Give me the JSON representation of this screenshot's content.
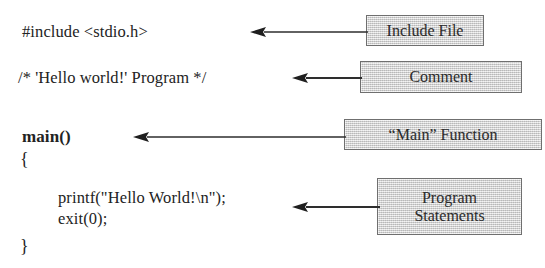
{
  "figure": {
    "background_color": "#ffffff",
    "box_fill_color": "#d6d6d6",
    "box_border_color": "#6f6f6f",
    "text_color": "#232323"
  },
  "code": {
    "lines": [
      {
        "id": "include",
        "text": "#include <stdio.h>",
        "bold": false
      },
      {
        "id": "comment",
        "text": "/* 'Hello world!' Program */",
        "bold": false
      },
      {
        "id": "main",
        "text": "main()",
        "bold": true
      },
      {
        "id": "open_brace",
        "text": "{",
        "bold": false
      },
      {
        "id": "printf",
        "text": "printf(\"Hello World!\\n\");",
        "bold": false
      },
      {
        "id": "exit",
        "text": "exit(0);",
        "bold": false
      },
      {
        "id": "close_brace",
        "text": "}",
        "bold": false
      }
    ]
  },
  "callouts": [
    {
      "id": "include_file",
      "label": "Include File"
    },
    {
      "id": "comment",
      "label": "Comment"
    },
    {
      "id": "main_function",
      "label": "“Main” Function"
    },
    {
      "id": "program_statements",
      "label_line1": "Program",
      "label_line2": "Statements"
    }
  ],
  "arrows": [
    {
      "id": "include_arrow",
      "direction": "left",
      "from": "Include File",
      "to": "#include <stdio.h>"
    },
    {
      "id": "comment_arrow",
      "direction": "left",
      "from": "Comment",
      "to": "/* 'Hello world!' Program */"
    },
    {
      "id": "main_arrow",
      "direction": "left",
      "from": "“Main” Function",
      "to": "main()"
    },
    {
      "id": "program_arrow",
      "direction": "left",
      "from": "Program Statements",
      "to": "printf / exit statements"
    }
  ]
}
